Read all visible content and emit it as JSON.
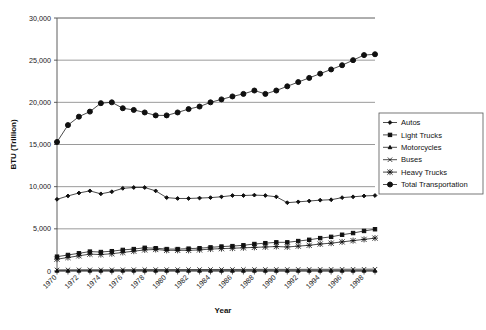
{
  "chart_data": {
    "type": "line",
    "title": "",
    "xlabel": "Year",
    "ylabel": "BTU (Trillion)",
    "ylim": [
      0,
      30000
    ],
    "ytick_labels": [
      "0",
      "5,000",
      "10,000",
      "15,000",
      "20,000",
      "25,000",
      "30,000"
    ],
    "ytick_values": [
      0,
      5000,
      10000,
      15000,
      20000,
      25000,
      30000
    ],
    "grid": "horizontal",
    "legend_position": "right",
    "x": [
      1970,
      1971,
      1972,
      1973,
      1974,
      1975,
      1976,
      1977,
      1978,
      1979,
      1980,
      1981,
      1982,
      1983,
      1984,
      1985,
      1986,
      1987,
      1988,
      1989,
      1990,
      1991,
      1992,
      1993,
      1994,
      1995,
      1996,
      1997,
      1998,
      1999
    ],
    "xtick_labels": [
      "1970",
      "1972",
      "1974",
      "1976",
      "1978",
      "1980",
      "1982",
      "1984",
      "1986",
      "1988",
      "1990",
      "1992",
      "1994",
      "1996",
      "1998"
    ],
    "xtick_values": [
      1970,
      1972,
      1974,
      1976,
      1978,
      1980,
      1982,
      1984,
      1986,
      1988,
      1990,
      1992,
      1994,
      1996,
      1998
    ],
    "series": [
      {
        "name": "Autos",
        "marker": "small-diamond",
        "values": [
          8500,
          8900,
          9250,
          9500,
          9150,
          9400,
          9800,
          9900,
          9900,
          9500,
          8700,
          8600,
          8600,
          8650,
          8700,
          8800,
          8950,
          8950,
          9000,
          8950,
          8800,
          8100,
          8200,
          8300,
          8400,
          8450,
          8700,
          8800,
          8900,
          8950
        ]
      },
      {
        "name": "Light Trucks",
        "marker": "filled-square",
        "values": [
          1700,
          1900,
          2100,
          2300,
          2250,
          2350,
          2500,
          2600,
          2750,
          2700,
          2600,
          2600,
          2650,
          2700,
          2800,
          2900,
          2950,
          3050,
          3200,
          3300,
          3400,
          3400,
          3550,
          3700,
          3900,
          4050,
          4300,
          4500,
          4750,
          4950
        ]
      },
      {
        "name": "Motorcycles",
        "marker": "small-triangle",
        "values": [
          20,
          22,
          25,
          28,
          26,
          27,
          28,
          29,
          30,
          30,
          28,
          27,
          26,
          26,
          25,
          25,
          24,
          24,
          24,
          23,
          23,
          22,
          22,
          22,
          22,
          22,
          23,
          23,
          23,
          24
        ]
      },
      {
        "name": "Buses",
        "marker": "x-cross",
        "values": [
          130,
          135,
          140,
          145,
          145,
          150,
          155,
          160,
          165,
          170,
          170,
          170,
          172,
          175,
          178,
          180,
          182,
          185,
          188,
          190,
          192,
          190,
          192,
          195,
          198,
          200,
          205,
          208,
          210,
          215
        ]
      },
      {
        "name": "Heavy Trucks",
        "marker": "asterisk",
        "values": [
          1400,
          1600,
          1800,
          2000,
          1950,
          2050,
          2200,
          2350,
          2500,
          2550,
          2450,
          2450,
          2450,
          2500,
          2600,
          2650,
          2700,
          2750,
          2800,
          2850,
          2900,
          2850,
          2950,
          3050,
          3200,
          3300,
          3450,
          3600,
          3750,
          3900
        ]
      },
      {
        "name": "Total Transportation",
        "marker": "large-circle",
        "values": [
          15300,
          17300,
          18300,
          18900,
          19900,
          20000,
          19300,
          19100,
          18800,
          18450,
          18450,
          18800,
          19200,
          19500,
          20000,
          20350,
          20700,
          21000,
          21400,
          21000,
          21400,
          21900,
          22400,
          22900,
          23400,
          23900,
          24400,
          25000,
          25600,
          25700
        ]
      }
    ]
  }
}
